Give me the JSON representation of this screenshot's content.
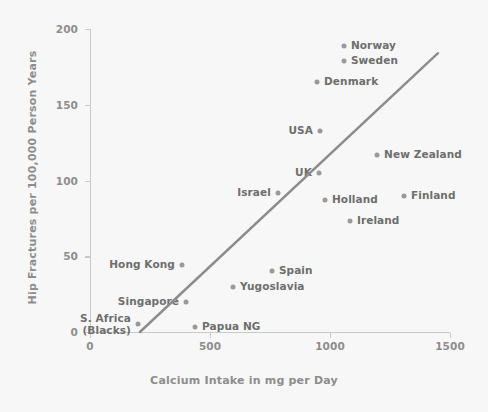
{
  "chart_data": {
    "type": "scatter",
    "title": "",
    "xlabel": "Calcium Intake in mg per Day",
    "ylabel": "Hip Fractures per 100,000 Person Years",
    "xlim": [
      0,
      1500
    ],
    "ylim": [
      0,
      200
    ],
    "xticks": [
      0,
      500,
      1000,
      1500
    ],
    "yticks": [
      0,
      50,
      100,
      150,
      200
    ],
    "xtick_labels": [
      "0",
      "500",
      "1000",
      "1500"
    ],
    "ytick_labels": [
      "0",
      "50",
      "100",
      "150",
      "200"
    ],
    "grid": false,
    "legend": false,
    "marker_color": "#9a9a9a",
    "label_color": "#6e6e6e",
    "axis_color": "#c9c9c9",
    "trendline_color": "#8c8c8c",
    "background_color": "#f7f7f7",
    "points": [
      {
        "name": "Norway",
        "x": 1058,
        "y": 189,
        "label_side": "right"
      },
      {
        "name": "Sweden",
        "x": 1058,
        "y": 179,
        "label_side": "right"
      },
      {
        "name": "Denmark",
        "x": 946,
        "y": 165,
        "label_side": "right"
      },
      {
        "name": "USA",
        "x": 958,
        "y": 133,
        "label_side": "left"
      },
      {
        "name": "New Zealand",
        "x": 1196,
        "y": 117,
        "label_side": "right"
      },
      {
        "name": "UK",
        "x": 954,
        "y": 105,
        "label_side": "left"
      },
      {
        "name": "Israel",
        "x": 783,
        "y": 92,
        "label_side": "left"
      },
      {
        "name": "Finland",
        "x": 1308,
        "y": 90,
        "label_side": "right"
      },
      {
        "name": "Holland",
        "x": 979,
        "y": 87,
        "label_side": "right"
      },
      {
        "name": "Ireland",
        "x": 1083,
        "y": 73,
        "label_side": "right"
      },
      {
        "name": "Hong Kong",
        "x": 383,
        "y": 44,
        "label_side": "left"
      },
      {
        "name": "Spain",
        "x": 758,
        "y": 40,
        "label_side": "right"
      },
      {
        "name": "Yugoslavia",
        "x": 596,
        "y": 30,
        "label_side": "right"
      },
      {
        "name": "Singapore",
        "x": 400,
        "y": 20,
        "label_side": "left"
      },
      {
        "name": "S. Africa\n(Blacks)",
        "x": 200,
        "y": 5,
        "label_side": "left"
      },
      {
        "name": "Papua NG",
        "x": 438,
        "y": 3,
        "label_side": "right"
      }
    ],
    "trendline": {
      "x_start": 208,
      "y_start": 0,
      "x_end": 1450,
      "y_end": 184
    }
  }
}
